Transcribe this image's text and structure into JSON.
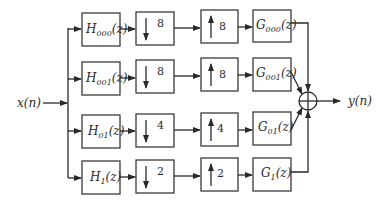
{
  "diagram": {
    "type": "block-diagram",
    "input_label": "x(n)",
    "output_label": "y(n)",
    "branches": [
      {
        "analysis": {
          "base": "H",
          "sub": "000",
          "arg": "(z)"
        },
        "down_factor": "8",
        "up_factor": "8",
        "synthesis": {
          "base": "G",
          "sub": "000",
          "arg": "(z)"
        }
      },
      {
        "analysis": {
          "base": "H",
          "sub": "001",
          "arg": "(z)"
        },
        "down_factor": "8",
        "up_factor": "8",
        "synthesis": {
          "base": "G",
          "sub": "001",
          "arg": "(z)"
        }
      },
      {
        "analysis": {
          "base": "H",
          "sub": "01",
          "arg": "(z)"
        },
        "down_factor": "4",
        "up_factor": "4",
        "synthesis": {
          "base": "G",
          "sub": "01",
          "arg": "(z)"
        }
      },
      {
        "analysis": {
          "base": "H",
          "sub": "1",
          "arg": "(z)"
        },
        "down_factor": "2",
        "up_factor": "2",
        "synthesis": {
          "base": "G",
          "sub": "1",
          "arg": "(z)"
        }
      }
    ],
    "summing_junction": "⊕"
  }
}
